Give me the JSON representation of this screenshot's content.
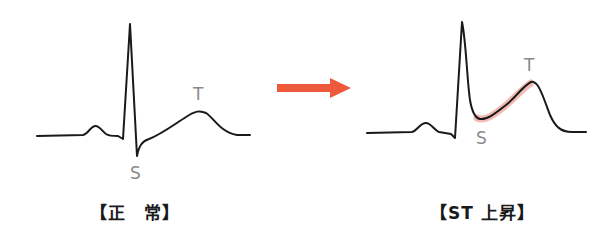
{
  "left_panel": {
    "caption": "【正　常】",
    "labels": {
      "s": "S",
      "t": "T"
    }
  },
  "right_panel": {
    "caption": "【ST 上昇】",
    "labels": {
      "s": "S",
      "t": "T"
    },
    "highlight_color": "#e8847a"
  },
  "arrow": {
    "color": "#ee5a3c",
    "icon": "right-arrow-icon"
  },
  "colors": {
    "waveform": "#1a1a1a",
    "label": "#8a8a8a"
  }
}
